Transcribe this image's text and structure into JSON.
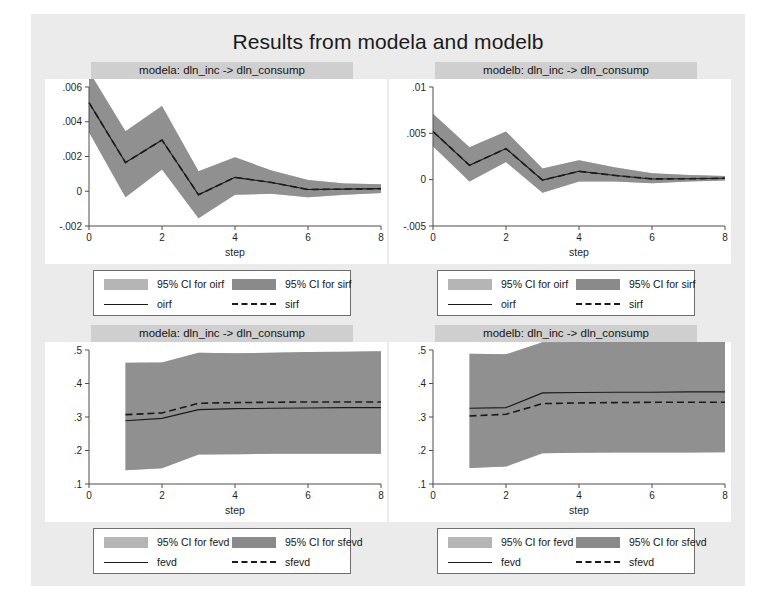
{
  "figure": {
    "title": "Results from modela and modelb",
    "background_color": "#ebebeb",
    "panel_title_color": "#cfcfcf"
  },
  "colors": {
    "ci_light": "#b5b5b5",
    "ci_dark": "#8a8a8a",
    "line": "#1a1a1a",
    "axis": "#4d4d4d",
    "plot_bg": "#ffffff"
  },
  "chart_data": [
    {
      "id": "irf-modela",
      "type": "line",
      "title": "modela: dln_inc -> dln_consump",
      "xlabel": "step",
      "ylabel": "",
      "xlim": [
        0,
        8
      ],
      "ylim": [
        -0.002,
        0.006
      ],
      "xticks": [
        0,
        2,
        4,
        6,
        8
      ],
      "xticklabels": [
        "0",
        "2",
        "4",
        "6",
        "8"
      ],
      "yticks": [
        -0.002,
        0,
        0.002,
        0.004,
        0.006
      ],
      "yticklabels": [
        "-.002",
        "0",
        ".002",
        ".004",
        ".006"
      ],
      "grid": false,
      "x": [
        0,
        1,
        2,
        3,
        4,
        5,
        6,
        7,
        8
      ],
      "series": [
        {
          "name": "oirf",
          "style": "solid",
          "values": [
            0.0051,
            0.00165,
            0.00295,
            -0.0002,
            0.0008,
            0.0005,
            0.0001,
            0.00012,
            0.00015
          ],
          "ci_name": "95% CI for oirf",
          "ci_shade": "ci_light",
          "ci_lower": [
            0.0034,
            -0.00035,
            0.00125,
            -0.00155,
            -0.0002,
            -0.00015,
            -0.00035,
            -0.0002,
            -0.0001
          ],
          "ci_upper": [
            0.0069,
            0.00345,
            0.0049,
            0.00115,
            0.00195,
            0.0012,
            0.00065,
            0.00045,
            0.0004
          ]
        },
        {
          "name": "sirf",
          "style": "dashed",
          "values": [
            0.0051,
            0.00165,
            0.00295,
            -0.0002,
            0.0008,
            0.0005,
            0.0001,
            0.00012,
            0.00015
          ],
          "ci_name": "95% CI for sirf",
          "ci_shade": "ci_dark",
          "ci_lower": [
            0.0034,
            -0.00035,
            0.00125,
            -0.00155,
            -0.0002,
            -0.00015,
            -0.00035,
            -0.0002,
            -0.0001
          ],
          "ci_upper": [
            0.0069,
            0.00345,
            0.0049,
            0.00115,
            0.00195,
            0.0012,
            0.00065,
            0.00045,
            0.0004
          ]
        }
      ],
      "legend": [
        {
          "kind": "swatch",
          "shade": "ci_light",
          "label": "95% CI for oirf"
        },
        {
          "kind": "swatch",
          "shade": "ci_dark",
          "label": "95% CI for sirf"
        },
        {
          "kind": "solid",
          "label": "oirf"
        },
        {
          "kind": "dashed",
          "label": "sirf"
        }
      ]
    },
    {
      "id": "irf-modelb",
      "type": "line",
      "title": "modelb: dln_inc -> dln_consump",
      "xlabel": "step",
      "ylabel": "",
      "xlim": [
        0,
        8
      ],
      "ylim": [
        -0.005,
        0.01
      ],
      "xticks": [
        0,
        2,
        4,
        6,
        8
      ],
      "xticklabels": [
        "0",
        "2",
        "4",
        "6",
        "8"
      ],
      "yticks": [
        -0.005,
        0,
        0.005,
        0.01
      ],
      "yticklabels": [
        "-.005",
        "0",
        ".005",
        ".01"
      ],
      "grid": false,
      "x": [
        0,
        1,
        2,
        3,
        4,
        5,
        6,
        7,
        8
      ],
      "series": [
        {
          "name": "oirf",
          "style": "solid",
          "values": [
            0.0052,
            0.00155,
            0.00335,
            -5e-05,
            0.0009,
            0.00045,
            8e-05,
            0.0001,
            0.00015
          ],
          "ci_name": "95% CI for oirf",
          "ci_shade": "ci_light",
          "ci_lower": [
            0.0036,
            -0.0002,
            0.0019,
            -0.0014,
            -0.0002,
            -0.0002,
            -0.0004,
            -0.0002,
            -8e-05
          ],
          "ci_upper": [
            0.0071,
            0.0035,
            0.0052,
            0.0012,
            0.0021,
            0.0013,
            0.0007,
            0.0005,
            0.0004
          ]
        },
        {
          "name": "sirf",
          "style": "dashed",
          "values": [
            0.0052,
            0.00155,
            0.00335,
            -5e-05,
            0.0009,
            0.00045,
            8e-05,
            0.0001,
            0.00015
          ],
          "ci_name": "95% CI for sirf",
          "ci_shade": "ci_dark",
          "ci_lower": [
            0.0036,
            -0.0002,
            0.0019,
            -0.0014,
            -0.0002,
            -0.0002,
            -0.0004,
            -0.0002,
            -8e-05
          ],
          "ci_upper": [
            0.0071,
            0.0035,
            0.0052,
            0.0012,
            0.0021,
            0.0013,
            0.0007,
            0.0005,
            0.0004
          ]
        }
      ],
      "legend": [
        {
          "kind": "swatch",
          "shade": "ci_light",
          "label": "95% CI for oirf"
        },
        {
          "kind": "swatch",
          "shade": "ci_dark",
          "label": "95% CI for sirf"
        },
        {
          "kind": "solid",
          "label": "oirf"
        },
        {
          "kind": "dashed",
          "label": "sirf"
        }
      ]
    },
    {
      "id": "fevd-modela",
      "type": "line",
      "title": "modela: dln_inc -> dln_consump",
      "xlabel": "step",
      "ylabel": "",
      "xlim": [
        0,
        8
      ],
      "ylim": [
        0.1,
        0.5
      ],
      "xticks": [
        0,
        2,
        4,
        6,
        8
      ],
      "xticklabels": [
        "0",
        "2",
        "4",
        "6",
        "8"
      ],
      "yticks": [
        0.1,
        0.2,
        0.3,
        0.4,
        0.5
      ],
      "yticklabels": [
        ".1",
        ".2",
        ".3",
        ".4",
        ".5"
      ],
      "grid": false,
      "x": [
        1,
        2,
        3,
        4,
        5,
        6,
        7,
        8
      ],
      "series": [
        {
          "name": "fevd",
          "style": "solid",
          "values": [
            0.289,
            0.296,
            0.322,
            0.325,
            0.326,
            0.327,
            0.328,
            0.328
          ],
          "ci_name": "95% CI for fevd",
          "ci_shade": "ci_light",
          "ci_lower": [
            0.141,
            0.147,
            0.188,
            0.189,
            0.19,
            0.19,
            0.19,
            0.19
          ],
          "ci_upper": [
            0.462,
            0.463,
            0.492,
            0.49,
            0.492,
            0.494,
            0.495,
            0.496
          ]
        },
        {
          "name": "sfevd",
          "style": "dashed",
          "values": [
            0.307,
            0.312,
            0.341,
            0.343,
            0.344,
            0.345,
            0.345,
            0.345
          ],
          "ci_name": "95% CI for sfevd",
          "ci_shade": "ci_dark",
          "ci_lower": [
            0.141,
            0.147,
            0.188,
            0.189,
            0.19,
            0.19,
            0.19,
            0.19
          ],
          "ci_upper": [
            0.462,
            0.463,
            0.492,
            0.49,
            0.492,
            0.494,
            0.495,
            0.496
          ]
        }
      ],
      "legend": [
        {
          "kind": "swatch",
          "shade": "ci_light",
          "label": "95% CI for fevd"
        },
        {
          "kind": "swatch",
          "shade": "ci_dark",
          "label": "95% CI for sfevd"
        },
        {
          "kind": "solid",
          "label": "fevd"
        },
        {
          "kind": "dashed",
          "label": "sfevd"
        }
      ]
    },
    {
      "id": "fevd-modelb",
      "type": "line",
      "title": "modelb: dln_inc -> dln_consump",
      "xlabel": "step",
      "ylabel": "",
      "xlim": [
        0,
        8
      ],
      "ylim": [
        0.1,
        0.5
      ],
      "xticks": [
        0,
        2,
        4,
        6,
        8
      ],
      "xticklabels": [
        "0",
        "2",
        "4",
        "6",
        "8"
      ],
      "yticks": [
        0.1,
        0.2,
        0.3,
        0.4,
        0.5
      ],
      "yticklabels": [
        ".1",
        ".2",
        ".3",
        ".4",
        ".5"
      ],
      "grid": false,
      "x": [
        1,
        2,
        3,
        4,
        5,
        6,
        7,
        8
      ],
      "series": [
        {
          "name": "fevd",
          "style": "solid",
          "values": [
            0.326,
            0.328,
            0.372,
            0.373,
            0.374,
            0.374,
            0.375,
            0.375
          ],
          "ci_name": "95% CI for fevd",
          "ci_shade": "ci_light",
          "ci_lower": [
            0.148,
            0.152,
            0.192,
            0.193,
            0.194,
            0.194,
            0.194,
            0.195
          ],
          "ci_upper": [
            0.489,
            0.487,
            0.523,
            0.524,
            0.525,
            0.526,
            0.527,
            0.527
          ]
        },
        {
          "name": "sfevd",
          "style": "dashed",
          "values": [
            0.303,
            0.308,
            0.34,
            0.342,
            0.343,
            0.344,
            0.344,
            0.344
          ],
          "ci_name": "95% CI for sfevd",
          "ci_shade": "ci_dark",
          "ci_lower": [
            0.148,
            0.152,
            0.192,
            0.193,
            0.194,
            0.194,
            0.194,
            0.195
          ],
          "ci_upper": [
            0.489,
            0.487,
            0.523,
            0.524,
            0.525,
            0.526,
            0.527,
            0.527
          ]
        }
      ],
      "legend": [
        {
          "kind": "swatch",
          "shade": "ci_light",
          "label": "95% CI for fevd"
        },
        {
          "kind": "swatch",
          "shade": "ci_dark",
          "label": "95% CI for sfevd"
        },
        {
          "kind": "solid",
          "label": "fevd"
        },
        {
          "kind": "dashed",
          "label": "sfevd"
        }
      ]
    }
  ]
}
